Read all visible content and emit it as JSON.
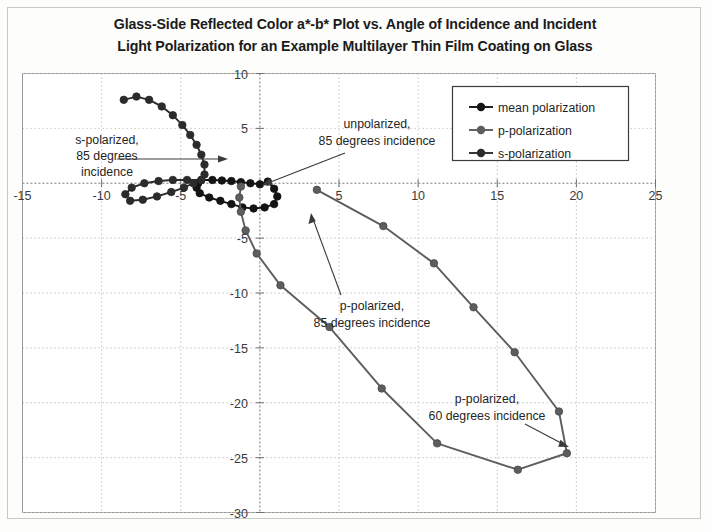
{
  "figure": {
    "title_line1": "Glass-Side Reflected Color a*-b* Plot vs. Angle of Incidence and Incident",
    "title_line2": "Light Polarization for an Example Multilayer Thin Film Coating on Glass"
  },
  "legend": {
    "position": "top-right-inside",
    "items": [
      {
        "label": "mean polarization",
        "color": "#141414",
        "marker": "filled-circle"
      },
      {
        "label": "p-polarization",
        "color": "#5d5d5d",
        "marker": "filled-circle"
      },
      {
        "label": "s-polarization",
        "color": "#2b2b2b",
        "marker": "filled-circle"
      }
    ]
  },
  "annotations": [
    {
      "id": "s-pol-85",
      "line1": "s-polarized,",
      "line2": "85 degrees",
      "line3": "incidence"
    },
    {
      "id": "unpolarized-85",
      "line1": "unpolarized,",
      "line2": "85 degrees incidence"
    },
    {
      "id": "p-pol-85",
      "line1": "p-polarized,",
      "line2": "85 degrees incidence"
    },
    {
      "id": "p-pol-60",
      "line1": "p-polarized,",
      "line2": "60 degrees incidence"
    }
  ],
  "chart_data": {
    "type": "scatter",
    "title": "Glass-Side Reflected Color a*-b* Plot vs. Angle of Incidence and Incident Light Polarization for an Example Multilayer Thin Film Coating on Glass",
    "xlabel": "a*",
    "ylabel": "b*",
    "xlim": [
      -15,
      25
    ],
    "ylim": [
      -30,
      10
    ],
    "xticks": [
      -15,
      -10,
      -5,
      0,
      5,
      10,
      15,
      20,
      25
    ],
    "yticks": [
      -30,
      -25,
      -20,
      -15,
      -10,
      -5,
      0,
      5,
      10
    ],
    "xtick_labels": [
      "-15",
      "-10",
      "-5",
      "",
      "5",
      "10",
      "15",
      "20",
      "25"
    ],
    "ytick_labels": [
      "-30",
      "-25",
      "-20",
      "-15",
      "-10",
      "-5",
      "",
      "5",
      "10"
    ],
    "grid": true,
    "grid_style": "dotted",
    "legend": [
      "mean polarization",
      "p-polarization",
      "s-polarization"
    ],
    "series": [
      {
        "name": "mean polarization",
        "color": "#141414",
        "marker": "filled-circle",
        "marker_size": 7.5,
        "points": [
          [
            -3.7,
            0.3
          ],
          [
            -3.0,
            0.3
          ],
          [
            -2.4,
            0.25
          ],
          [
            -1.8,
            0.2
          ],
          [
            -1.2,
            0.1
          ],
          [
            -0.6,
            0.0
          ],
          [
            0.0,
            -0.1
          ],
          [
            0.5,
            0.15
          ],
          [
            0.9,
            -0.5
          ],
          [
            1.1,
            -1.2
          ],
          [
            0.9,
            -1.9
          ],
          [
            0.3,
            -2.2
          ],
          [
            -0.4,
            -2.3
          ],
          [
            -1.1,
            -2.2
          ],
          [
            -1.8,
            -1.9
          ],
          [
            -2.5,
            -1.6
          ],
          [
            -3.2,
            -1.3
          ],
          [
            -3.8,
            -0.9
          ],
          [
            -4.0,
            -0.4
          ],
          [
            -3.9,
            0.0
          ]
        ]
      },
      {
        "name": "s-polarization",
        "color": "#2b2b2b",
        "marker": "filled-circle",
        "marker_size": 7.5,
        "points": [
          [
            -8.6,
            7.6
          ],
          [
            -7.8,
            7.9
          ],
          [
            -7.0,
            7.6
          ],
          [
            -6.2,
            7.0
          ],
          [
            -5.5,
            6.2
          ],
          [
            -4.9,
            5.3
          ],
          [
            -4.4,
            4.4
          ],
          [
            -4.0,
            3.5
          ],
          [
            -3.7,
            2.6
          ],
          [
            -3.5,
            1.7
          ],
          [
            -3.5,
            0.8
          ],
          [
            -3.7,
            0.3
          ],
          [
            -4.6,
            0.3
          ],
          [
            -5.5,
            0.3
          ],
          [
            -6.4,
            0.2
          ],
          [
            -7.3,
            0.0
          ],
          [
            -8.1,
            -0.4
          ],
          [
            -8.5,
            -1.0
          ],
          [
            -8.2,
            -1.6
          ],
          [
            -7.4,
            -1.5
          ],
          [
            -6.5,
            -1.2
          ],
          [
            -5.6,
            -0.8
          ],
          [
            -4.8,
            -0.4
          ],
          [
            -4.2,
            0.0
          ]
        ]
      },
      {
        "name": "p-polarization",
        "color": "#5d5d5d",
        "marker": "filled-circle",
        "marker_size": 7.5,
        "points": [
          [
            3.6,
            -0.6
          ],
          [
            7.8,
            -3.9
          ],
          [
            11.0,
            -7.3
          ],
          [
            13.5,
            -11.3
          ],
          [
            16.1,
            -15.4
          ],
          [
            18.9,
            -20.8
          ],
          [
            19.4,
            -24.6
          ],
          [
            16.3,
            -26.1
          ],
          [
            11.2,
            -23.7
          ],
          [
            7.7,
            -18.7
          ],
          [
            4.4,
            -13.1
          ],
          [
            1.3,
            -9.3
          ],
          [
            -0.2,
            -6.4
          ],
          [
            -0.9,
            -4.3
          ],
          [
            -1.2,
            -2.6
          ],
          [
            -1.3,
            -1.3
          ],
          [
            -1.2,
            -0.3
          ]
        ]
      }
    ]
  }
}
